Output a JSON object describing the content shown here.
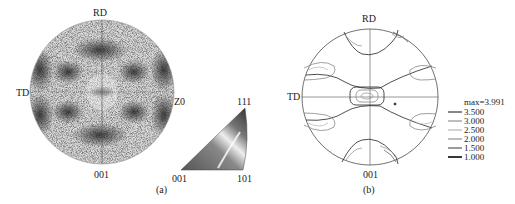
{
  "panel_a": {
    "caption": "(a)",
    "labels": {
      "top": "RD",
      "left": "TD",
      "right": "Z0",
      "bottom": "001"
    },
    "ipf_triangle": {
      "top": "111",
      "bottom_left": "001",
      "bottom_right": "101"
    }
  },
  "panel_b": {
    "caption": "(b)",
    "labels": {
      "top": "RD",
      "left": "TD",
      "bottom": "001"
    },
    "legend": {
      "max_label": "max=3.991",
      "levels": [
        {
          "value": "3.500",
          "color": "#444444"
        },
        {
          "value": "3.000",
          "color": "#999999"
        },
        {
          "value": "2.500",
          "color": "#bbbbbb"
        },
        {
          "value": "2.000",
          "color": "#999999"
        },
        {
          "value": "1.500",
          "color": "#666666"
        },
        {
          "value": "1.000",
          "color": "#222222"
        }
      ]
    }
  }
}
